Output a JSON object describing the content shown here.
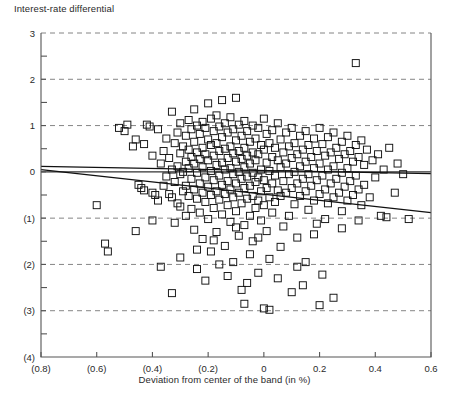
{
  "figure": {
    "y_axis_title": "Interest-rate differential",
    "x_axis_title": "Deviation from center of the band (in %)",
    "caption": ""
  },
  "chart_data": {
    "type": "scatter",
    "title": "",
    "ylabel": "Interest-rate differential",
    "xlabel": "Deviation from center of the band (in %)",
    "xlim": [
      -0.8,
      0.6
    ],
    "ylim": [
      -4,
      3
    ],
    "xticks": [
      -0.8,
      -0.6,
      -0.4,
      -0.2,
      0,
      0.2,
      0.4,
      0.6
    ],
    "xticklabels": [
      "(0.8)",
      "(0.6)",
      "(0.4)",
      "(0.2)",
      "0",
      "0.2",
      "0.4",
      "0.6"
    ],
    "yticks": [
      -4,
      -3,
      -2,
      -1,
      0,
      1,
      2,
      3
    ],
    "yticklabels": [
      "(4)",
      "(3)",
      "(2)",
      "(1)",
      "0",
      "1",
      "2",
      "3"
    ],
    "minor_yticks": [
      -3.5,
      -2.5,
      -1.5,
      -0.5,
      0.5,
      1.5,
      2.5
    ],
    "grid": "horizontal-dashed-at-major-y",
    "marker": "open-square",
    "marker_color": "#000000",
    "legend": null,
    "trend_lines": [
      {
        "name": "flat-fit",
        "x": [
          -0.8,
          0.6
        ],
        "y": [
          0.12,
          -0.04
        ]
      },
      {
        "name": "steep-fit",
        "x": [
          -0.8,
          0.6
        ],
        "y": [
          0.05,
          -0.88
        ]
      }
    ],
    "points": [
      [
        -0.6,
        -0.72
      ],
      [
        -0.57,
        -1.55
      ],
      [
        -0.56,
        -1.72
      ],
      [
        -0.52,
        0.95
      ],
      [
        -0.5,
        0.88
      ],
      [
        -0.49,
        1.02
      ],
      [
        -0.47,
        0.55
      ],
      [
        -0.46,
        0.7
      ],
      [
        -0.45,
        -0.28
      ],
      [
        -0.44,
        -0.35
      ],
      [
        -0.43,
        -0.4
      ],
      [
        -0.43,
        0.6
      ],
      [
        -0.42,
        1.02
      ],
      [
        -0.41,
        0.98
      ],
      [
        -0.4,
        -0.45
      ],
      [
        -0.4,
        0.35
      ],
      [
        -0.39,
        -0.5
      ],
      [
        -0.38,
        0.92
      ],
      [
        -0.38,
        -0.62
      ],
      [
        -0.37,
        0.18
      ],
      [
        -0.37,
        -2.05
      ],
      [
        -0.36,
        0.45
      ],
      [
        -0.36,
        -0.3
      ],
      [
        -0.35,
        0.72
      ],
      [
        -0.35,
        -0.1
      ],
      [
        -0.34,
        0.3
      ],
      [
        -0.34,
        -0.48
      ],
      [
        -0.33,
        1.3
      ],
      [
        -0.33,
        0.05
      ],
      [
        -0.33,
        -0.55
      ],
      [
        -0.32,
        0.62
      ],
      [
        -0.32,
        -0.22
      ],
      [
        -0.32,
        -1.1
      ],
      [
        -0.31,
        0.85
      ],
      [
        -0.31,
        0.12
      ],
      [
        -0.31,
        -0.68
      ],
      [
        -0.3,
        1.05
      ],
      [
        -0.3,
        0.4
      ],
      [
        -0.3,
        -0.05
      ],
      [
        -0.3,
        -0.75
      ],
      [
        -0.3,
        -1.85
      ],
      [
        -0.29,
        0.55
      ],
      [
        -0.29,
        0.0
      ],
      [
        -0.29,
        -0.42
      ],
      [
        -0.28,
        0.78
      ],
      [
        -0.28,
        0.22
      ],
      [
        -0.28,
        -0.3
      ],
      [
        -0.28,
        -0.95
      ],
      [
        -0.27,
        1.12
      ],
      [
        -0.27,
        0.48
      ],
      [
        -0.27,
        0.08
      ],
      [
        -0.27,
        -0.52
      ],
      [
        -0.26,
        0.92
      ],
      [
        -0.26,
        0.32
      ],
      [
        -0.26,
        -0.15
      ],
      [
        -0.26,
        -0.8
      ],
      [
        -0.25,
        1.35
      ],
      [
        -0.25,
        0.65
      ],
      [
        -0.25,
        0.18
      ],
      [
        -0.25,
        -0.38
      ],
      [
        -0.25,
        -1.25
      ],
      [
        -0.24,
        1.0
      ],
      [
        -0.24,
        0.42
      ],
      [
        -0.24,
        -0.02
      ],
      [
        -0.24,
        -0.58
      ],
      [
        -0.24,
        -2.1
      ],
      [
        -0.23,
        0.82
      ],
      [
        -0.23,
        0.28
      ],
      [
        -0.23,
        -0.25
      ],
      [
        -0.23,
        -0.88
      ],
      [
        -0.22,
        1.08
      ],
      [
        -0.22,
        0.52
      ],
      [
        -0.22,
        0.1
      ],
      [
        -0.22,
        -0.45
      ],
      [
        -0.22,
        -1.45
      ],
      [
        -0.21,
        0.95
      ],
      [
        -0.21,
        0.38
      ],
      [
        -0.21,
        -0.12
      ],
      [
        -0.21,
        -0.65
      ],
      [
        -0.21,
        -2.35
      ],
      [
        -0.2,
        1.48
      ],
      [
        -0.2,
        0.7
      ],
      [
        -0.2,
        0.25
      ],
      [
        -0.2,
        -0.32
      ],
      [
        -0.2,
        -1.02
      ],
      [
        -0.19,
        1.15
      ],
      [
        -0.19,
        0.58
      ],
      [
        -0.19,
        0.02
      ],
      [
        -0.19,
        -0.5
      ],
      [
        -0.19,
        -1.72
      ],
      [
        -0.18,
        0.88
      ],
      [
        -0.18,
        0.35
      ],
      [
        -0.18,
        -0.18
      ],
      [
        -0.18,
        -0.78
      ],
      [
        -0.17,
        1.22
      ],
      [
        -0.17,
        0.62
      ],
      [
        -0.17,
        0.15
      ],
      [
        -0.17,
        -0.42
      ],
      [
        -0.17,
        -1.3
      ],
      [
        -0.16,
        0.98
      ],
      [
        -0.16,
        0.45
      ],
      [
        -0.16,
        -0.08
      ],
      [
        -0.16,
        -0.6
      ],
      [
        -0.16,
        -2.0
      ],
      [
        -0.15,
        1.55
      ],
      [
        -0.15,
        0.75
      ],
      [
        -0.15,
        0.2
      ],
      [
        -0.15,
        -0.28
      ],
      [
        -0.15,
        -0.92
      ],
      [
        -0.14,
        1.05
      ],
      [
        -0.14,
        0.5
      ],
      [
        -0.14,
        0.05
      ],
      [
        -0.14,
        -0.48
      ],
      [
        -0.14,
        -1.6
      ],
      [
        -0.13,
        0.85
      ],
      [
        -0.13,
        0.3
      ],
      [
        -0.13,
        -0.2
      ],
      [
        -0.13,
        -0.72
      ],
      [
        -0.13,
        -2.25
      ],
      [
        -0.12,
        1.18
      ],
      [
        -0.12,
        0.55
      ],
      [
        -0.12,
        0.08
      ],
      [
        -0.12,
        -0.38
      ],
      [
        -0.12,
        -1.08
      ],
      [
        -0.11,
        0.92
      ],
      [
        -0.11,
        0.4
      ],
      [
        -0.11,
        -0.05
      ],
      [
        -0.11,
        -0.55
      ],
      [
        -0.11,
        -1.95
      ],
      [
        -0.1,
        1.6
      ],
      [
        -0.1,
        0.68
      ],
      [
        -0.1,
        0.22
      ],
      [
        -0.1,
        -0.25
      ],
      [
        -0.1,
        -0.85
      ],
      [
        -0.09,
        1.02
      ],
      [
        -0.09,
        0.45
      ],
      [
        -0.09,
        0.0
      ],
      [
        -0.09,
        -0.45
      ],
      [
        -0.09,
        -1.38
      ],
      [
        -0.08,
        0.78
      ],
      [
        -0.08,
        0.28
      ],
      [
        -0.08,
        -0.15
      ],
      [
        -0.08,
        -0.68
      ],
      [
        -0.08,
        -2.55
      ],
      [
        -0.07,
        1.1
      ],
      [
        -0.07,
        0.52
      ],
      [
        -0.07,
        0.1
      ],
      [
        -0.07,
        -0.35
      ],
      [
        -0.07,
        -1.15
      ],
      [
        -0.06,
        0.88
      ],
      [
        -0.06,
        0.35
      ],
      [
        -0.06,
        -0.1
      ],
      [
        -0.06,
        -0.58
      ],
      [
        -0.06,
        -2.4
      ],
      [
        -0.05,
        0.65
      ],
      [
        -0.05,
        0.18
      ],
      [
        -0.05,
        -0.3
      ],
      [
        -0.05,
        -0.95
      ],
      [
        -0.05,
        -1.78
      ],
      [
        -0.04,
        1.0
      ],
      [
        -0.04,
        0.42
      ],
      [
        -0.04,
        -0.02
      ],
      [
        -0.04,
        -0.52
      ],
      [
        -0.04,
        -1.5
      ],
      [
        -0.03,
        0.72
      ],
      [
        -0.03,
        0.25
      ],
      [
        -0.03,
        -0.22
      ],
      [
        -0.03,
        -0.78
      ],
      [
        -0.02,
        0.95
      ],
      [
        -0.02,
        0.38
      ],
      [
        -0.02,
        -0.12
      ],
      [
        -0.02,
        -0.62
      ],
      [
        -0.02,
        -2.18
      ],
      [
        -0.01,
        0.58
      ],
      [
        -0.01,
        0.05
      ],
      [
        -0.01,
        -0.42
      ],
      [
        -0.01,
        -1.05
      ],
      [
        0.0,
        1.15
      ],
      [
        0.0,
        0.48
      ],
      [
        0.0,
        -0.18
      ],
      [
        0.0,
        -0.72
      ],
      [
        0.0,
        -2.95
      ],
      [
        0.01,
        0.82
      ],
      [
        0.01,
        0.2
      ],
      [
        0.01,
        -0.35
      ],
      [
        0.01,
        -1.28
      ],
      [
        0.02,
        0.62
      ],
      [
        0.02,
        0.02
      ],
      [
        0.02,
        -0.55
      ],
      [
        0.02,
        -1.88
      ],
      [
        0.03,
        0.9
      ],
      [
        0.03,
        0.32
      ],
      [
        0.03,
        -0.25
      ],
      [
        0.03,
        -0.88
      ],
      [
        0.04,
        0.52
      ],
      [
        0.04,
        -0.08
      ],
      [
        0.04,
        -0.65
      ],
      [
        0.05,
        1.05
      ],
      [
        0.05,
        0.25
      ],
      [
        0.05,
        -0.4
      ],
      [
        0.05,
        -2.3
      ],
      [
        0.06,
        0.7
      ],
      [
        0.06,
        0.1
      ],
      [
        0.06,
        -0.52
      ],
      [
        0.07,
        0.42
      ],
      [
        0.07,
        -0.2
      ],
      [
        0.07,
        -1.18
      ],
      [
        0.08,
        0.85
      ],
      [
        0.08,
        0.18
      ],
      [
        0.08,
        -0.45
      ],
      [
        0.09,
        0.55
      ],
      [
        0.09,
        -0.05
      ],
      [
        0.09,
        -0.95
      ],
      [
        0.1,
        0.95
      ],
      [
        0.1,
        0.3
      ],
      [
        0.1,
        -0.35
      ],
      [
        0.1,
        -2.6
      ],
      [
        0.11,
        0.62
      ],
      [
        0.11,
        0.0
      ],
      [
        0.11,
        -0.7
      ],
      [
        0.12,
        0.38
      ],
      [
        0.12,
        -0.25
      ],
      [
        0.12,
        -1.42
      ],
      [
        0.13,
        0.78
      ],
      [
        0.13,
        0.12
      ],
      [
        0.13,
        -0.52
      ],
      [
        0.14,
        0.48
      ],
      [
        0.14,
        -0.15
      ],
      [
        0.15,
        0.88
      ],
      [
        0.15,
        0.22
      ],
      [
        0.15,
        -0.42
      ],
      [
        0.15,
        -1.95
      ],
      [
        0.16,
        0.58
      ],
      [
        0.16,
        -0.05
      ],
      [
        0.16,
        -0.82
      ],
      [
        0.17,
        0.32
      ],
      [
        0.17,
        -0.3
      ],
      [
        0.18,
        0.72
      ],
      [
        0.18,
        0.08
      ],
      [
        0.18,
        -0.62
      ],
      [
        0.19,
        0.45
      ],
      [
        0.19,
        -0.18
      ],
      [
        0.19,
        -1.12
      ],
      [
        0.2,
        0.95
      ],
      [
        0.2,
        0.18
      ],
      [
        0.2,
        -0.48
      ],
      [
        0.2,
        -2.88
      ],
      [
        0.21,
        0.6
      ],
      [
        0.21,
        -0.08
      ],
      [
        0.22,
        0.35
      ],
      [
        0.22,
        -0.38
      ],
      [
        0.22,
        -1.02
      ],
      [
        0.23,
        0.75
      ],
      [
        0.23,
        0.05
      ],
      [
        0.23,
        -0.68
      ],
      [
        0.24,
        0.42
      ],
      [
        0.24,
        -0.25
      ],
      [
        0.25,
        0.85
      ],
      [
        0.25,
        0.12
      ],
      [
        0.25,
        -0.55
      ],
      [
        0.25,
        -2.72
      ],
      [
        0.26,
        0.52
      ],
      [
        0.26,
        -0.15
      ],
      [
        0.27,
        0.28
      ],
      [
        0.27,
        -0.45
      ],
      [
        0.28,
        0.65
      ],
      [
        0.28,
        -0.02
      ],
      [
        0.28,
        -0.85
      ],
      [
        0.29,
        0.38
      ],
      [
        0.29,
        -0.32
      ],
      [
        0.3,
        0.78
      ],
      [
        0.3,
        0.08
      ],
      [
        0.3,
        -0.62
      ],
      [
        0.31,
        0.45
      ],
      [
        0.31,
        -0.2
      ],
      [
        0.32,
        0.22
      ],
      [
        0.32,
        -0.5
      ],
      [
        0.33,
        2.35
      ],
      [
        0.33,
        0.58
      ],
      [
        0.33,
        -0.08
      ],
      [
        0.34,
        0.32
      ],
      [
        0.34,
        -0.38
      ],
      [
        0.35,
        0.68
      ],
      [
        0.35,
        -0.72
      ],
      [
        0.36,
        0.15
      ],
      [
        0.36,
        -0.28
      ],
      [
        0.37,
        0.48
      ],
      [
        0.38,
        -0.55
      ],
      [
        0.39,
        0.25
      ],
      [
        0.4,
        -0.12
      ],
      [
        0.41,
        0.38
      ],
      [
        0.42,
        -0.95
      ],
      [
        0.43,
        0.05
      ],
      [
        0.44,
        -0.98
      ],
      [
        0.45,
        0.52
      ],
      [
        0.47,
        -0.45
      ],
      [
        0.48,
        0.18
      ],
      [
        0.5,
        -0.05
      ],
      [
        0.52,
        -1.02
      ],
      [
        0.34,
        -1.05
      ],
      [
        0.28,
        -1.22
      ],
      [
        0.18,
        -1.35
      ],
      [
        0.12,
        -2.05
      ],
      [
        0.06,
        -1.62
      ],
      [
        -0.02,
        -1.42
      ],
      [
        -0.1,
        -1.2
      ],
      [
        -0.18,
        -1.48
      ],
      [
        -0.24,
        -1.68
      ],
      [
        -0.4,
        -1.05
      ],
      [
        -0.46,
        -1.28
      ],
      [
        -0.33,
        -2.62
      ],
      [
        -0.07,
        -2.85
      ],
      [
        0.02,
        -2.98
      ],
      [
        0.14,
        -2.45
      ],
      [
        0.21,
        -2.22
      ]
    ]
  }
}
